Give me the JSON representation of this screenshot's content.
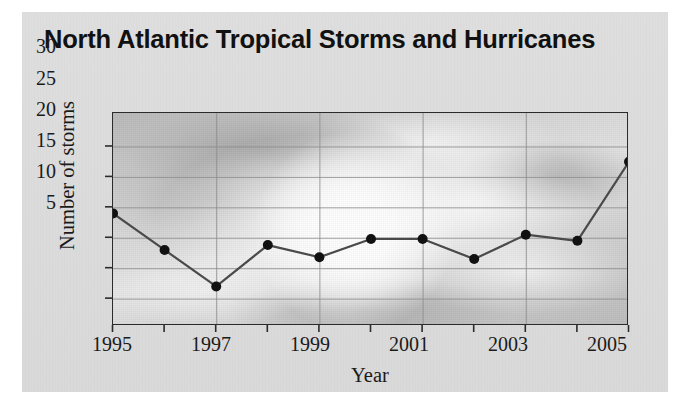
{
  "figure": {
    "title": "North Atlantic Tropical Storms\nand Hurricanes",
    "card_color": "#dcdcdc",
    "frame_color": "#2b2b2b",
    "line_color": "#4a4a4a",
    "marker_color": "#111111",
    "gridline_color": "#8d8d8d",
    "background_kind": "grayscale-hurricane-satellite-photo"
  },
  "chart_data": {
    "type": "line",
    "title": "North Atlantic Tropical Storms and Hurricanes",
    "xlabel": "Year",
    "ylabel": "Number of storms",
    "x": [
      1995,
      1996,
      1997,
      1998,
      1999,
      2000,
      2001,
      2002,
      2003,
      2004,
      2005
    ],
    "values": [
      19,
      13,
      7,
      13.8,
      11.8,
      14.8,
      14.8,
      11.5,
      15.5,
      14.5,
      27.5
    ],
    "series": [
      {
        "name": "Number of storms",
        "values": [
          19,
          13,
          7,
          13.8,
          11.8,
          14.8,
          14.8,
          11.5,
          15.5,
          14.5,
          27.5
        ]
      }
    ],
    "xlim": [
      1995,
      2005
    ],
    "ylim": [
      0.5,
      35.5
    ],
    "x_tick_values": [
      1995,
      1996,
      1997,
      1998,
      1999,
      2000,
      2001,
      2002,
      2003,
      2004,
      2005
    ],
    "x_tick_labels": [
      "1995",
      "",
      "1997",
      "",
      "1999",
      "",
      "2001",
      "",
      "2003",
      "",
      "2005"
    ],
    "x_major_labels": [
      "1995",
      "1997",
      "1999",
      "2001",
      "2003",
      "2005"
    ],
    "y_ticks": [
      5,
      10,
      15,
      20,
      25,
      30
    ],
    "y_tick_labels": [
      "5",
      "10",
      "15",
      "20",
      "25",
      "30"
    ],
    "grid": true,
    "grid_axis": "both",
    "legend": false,
    "markers": "filled-circle"
  }
}
